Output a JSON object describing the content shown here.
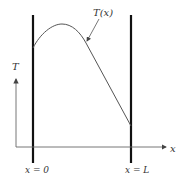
{
  "diagram": {
    "curve_label": "T(x)",
    "y_axis_label": "T",
    "x_axis_label": "x",
    "left_wall_label": "x = 0",
    "right_wall_label": "x = L",
    "colors": {
      "wall": "#111111",
      "axis": "#555555",
      "curve": "#444444",
      "text": "#333333"
    }
  }
}
